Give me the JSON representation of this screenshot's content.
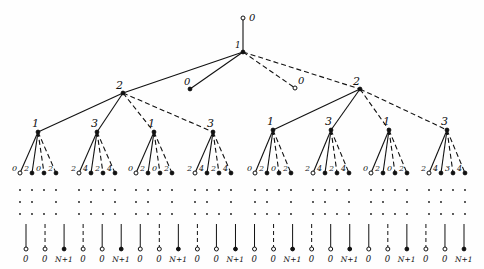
{
  "diagram": {
    "type": "tree",
    "root": {
      "label": "0",
      "x": 243,
      "y": 18
    },
    "level1": {
      "label": "1",
      "x": 243,
      "y": 52
    },
    "level1_leaves": [
      {
        "label": "0",
        "x": 190,
        "y": 89,
        "edge": "solid"
      },
      {
        "label": "0",
        "x": 295,
        "y": 88,
        "edge": "dashed"
      }
    ],
    "level2": [
      {
        "label": "2",
        "x": 123,
        "y": 93,
        "edge": "solid"
      },
      {
        "label": "2",
        "x": 360,
        "y": 89,
        "edge": "dashed"
      }
    ],
    "level3": [
      {
        "parent": 0,
        "label": "1",
        "x": 38,
        "y": 132,
        "edge": "solid"
      },
      {
        "parent": 0,
        "label": "3",
        "x": 97,
        "y": 132,
        "edge": "solid"
      },
      {
        "parent": 0,
        "label": "1",
        "x": 154,
        "y": 132,
        "edge": "dashed"
      },
      {
        "parent": 0,
        "label": "3",
        "x": 213,
        "y": 132,
        "edge": "dashed"
      },
      {
        "parent": 1,
        "label": "1",
        "x": 273,
        "y": 130,
        "edge": "solid"
      },
      {
        "parent": 1,
        "label": "3",
        "x": 331,
        "y": 130,
        "edge": "solid"
      },
      {
        "parent": 1,
        "label": "1",
        "x": 389,
        "y": 130,
        "edge": "dashed"
      },
      {
        "parent": 1,
        "label": "3",
        "x": 447,
        "y": 130,
        "edge": "dashed"
      }
    ],
    "level4_labels": [
      [
        "0",
        "2",
        "0",
        "2"
      ],
      [
        "2",
        "4",
        "2",
        "4"
      ],
      [
        "0",
        "2",
        "0",
        "2"
      ],
      [
        "2",
        "4",
        "2",
        "4"
      ],
      [
        "0",
        "2",
        "0",
        "2"
      ],
      [
        "2",
        "4",
        "2",
        "4"
      ],
      [
        "0",
        "2",
        "0",
        "2"
      ],
      [
        "2",
        "4",
        "3",
        "4"
      ]
    ],
    "bottom_labels": [
      "0",
      "0",
      "N+1",
      "0",
      "0",
      "N+1",
      "0",
      "0",
      "N+1",
      "0",
      "0",
      "N+1",
      "0",
      "0",
      "N+1",
      "0",
      "0",
      "N+1",
      "0",
      "0",
      "N+1",
      "0",
      "0",
      "N+1"
    ],
    "colors": {
      "ink": "#111111",
      "paper": "#fefefe"
    }
  }
}
